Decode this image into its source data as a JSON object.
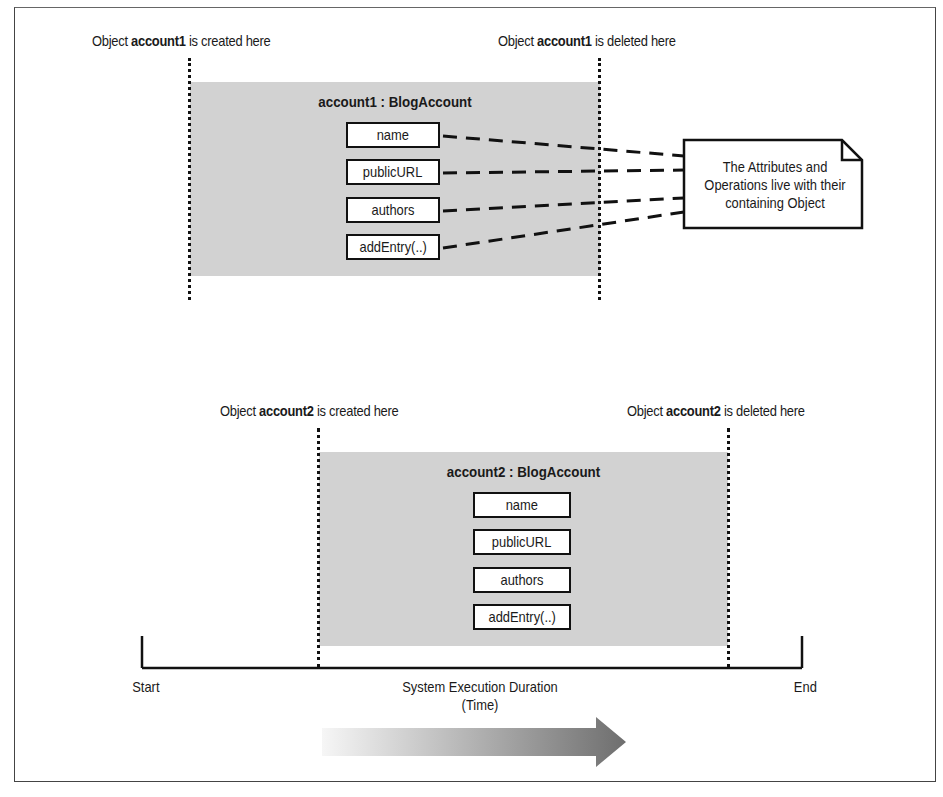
{
  "diagram": {
    "object1": {
      "title": "account1 : BlogAccount",
      "created_label": {
        "prefix": "Object ",
        "name": "account1",
        "suffix": " is created here"
      },
      "deleted_label": {
        "prefix": "Object ",
        "name": "account1",
        "suffix": " is deleted here"
      },
      "members": [
        "name",
        "publicURL",
        "authors",
        "addEntry(..)"
      ]
    },
    "object2": {
      "title": "account2 : BlogAccount",
      "created_label": {
        "prefix": "Object ",
        "name": "account2",
        "suffix": " is created here"
      },
      "deleted_label": {
        "prefix": "Object ",
        "name": "account2",
        "suffix": " is deleted here"
      },
      "members": [
        "name",
        "publicURL",
        "authors",
        "addEntry(..)"
      ]
    },
    "note": {
      "lines": [
        "The Attributes and",
        "Operations live with their",
        "containing Object"
      ]
    },
    "timeline": {
      "start_label": "Start",
      "end_label": "End",
      "caption_line1": "System Execution Duration",
      "caption_line2": "(Time)"
    },
    "colors": {
      "object_fill": "#d2d2d2",
      "line": "#111111",
      "arrow_start": "#f4f4f4",
      "arrow_end": "#6e6e6e"
    }
  }
}
